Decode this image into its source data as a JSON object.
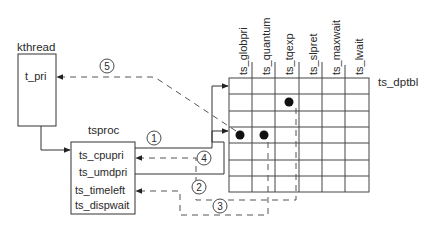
{
  "kthread": {
    "label": "kthread",
    "fields": [
      "t_pri"
    ]
  },
  "tsproc": {
    "label": "tsproc",
    "fields": [
      "ts_cpupri",
      "ts_umdpri",
      "ts_timeleft",
      "ts_dispwait"
    ]
  },
  "ts_dptbl": {
    "label": "ts_dptbl",
    "columns": [
      "ts_globpri",
      "ts_quantum",
      "ts_tqexp",
      "ts_slpret",
      "ts_maxwait",
      "ts_lwait"
    ],
    "rows": 7,
    "marked_cells": [
      {
        "row": 1,
        "col": 2
      },
      {
        "row": 3,
        "col": 0
      },
      {
        "row": 3,
        "col": 1
      }
    ]
  },
  "steps": [
    "1",
    "2",
    "3",
    "4",
    "5"
  ]
}
